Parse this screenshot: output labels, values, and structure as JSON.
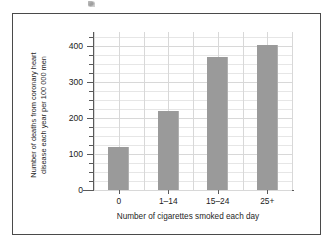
{
  "figure": {
    "frame_visible": true,
    "frame_color": "#4a4a4a",
    "background": "#ffffff",
    "artifact": "scan-speck"
  },
  "chart_data": {
    "type": "bar",
    "title": "",
    "categories": [
      "0",
      "1–14",
      "15–24",
      "25+"
    ],
    "values": [
      120,
      220,
      370,
      405
    ],
    "xlabel": "Number of cigarettes smoked each day",
    "ylabel": "Number of deaths from coronary heart disease each year per 100 000 men",
    "ylabel_line1": "Number of deaths from coronary heart",
    "ylabel_line2": "disease each year per 100 000 men",
    "ylim": [
      0,
      440
    ],
    "ytick_labels": [
      "0",
      "100",
      "200",
      "300",
      "400"
    ],
    "ytick_values": [
      0,
      100,
      200,
      300,
      400
    ],
    "yminor_step": 25,
    "grid": true,
    "legend": "none",
    "bar_color": "#9a9a9a",
    "grid_color": "#d8d8d8",
    "axis_color": "#5a5a5a"
  }
}
